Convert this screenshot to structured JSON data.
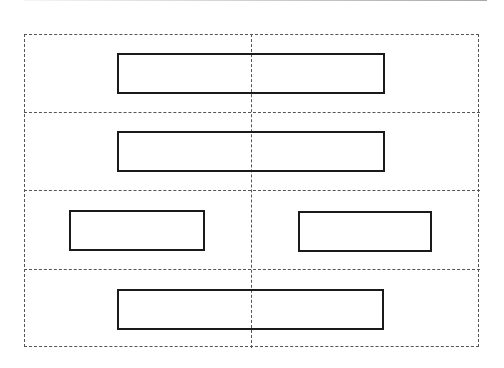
{
  "diagram": {
    "type": "layout-grid",
    "outer_frame": {
      "x": 24,
      "y": 34,
      "w": 456,
      "h": 314,
      "style": "dashed",
      "color": "#555555"
    },
    "center_divider_x": 251,
    "row_dividers_y": [
      112,
      190,
      269
    ],
    "rows": [
      {
        "index": 1,
        "boxes": [
          {
            "x": 117,
            "y": 53,
            "w": 268,
            "h": 41
          }
        ]
      },
      {
        "index": 2,
        "boxes": [
          {
            "x": 117,
            "y": 131,
            "w": 268,
            "h": 41
          }
        ]
      },
      {
        "index": 3,
        "boxes": [
          {
            "x": 69,
            "y": 210,
            "w": 136,
            "h": 41
          },
          {
            "x": 298,
            "y": 211,
            "w": 134,
            "h": 41
          }
        ]
      },
      {
        "index": 4,
        "boxes": [
          {
            "x": 117,
            "y": 289,
            "w": 267,
            "h": 41
          }
        ]
      }
    ],
    "colors": {
      "background": "#ffffff",
      "box_border": "#1a1a1a",
      "grid_line": "#555555"
    }
  }
}
